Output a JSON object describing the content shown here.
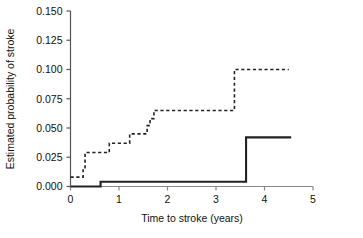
{
  "chart_data": {
    "type": "line",
    "title": "",
    "xlabel": "Time to stroke (years)",
    "ylabel": "Estimated probability of stroke",
    "xlim": [
      0,
      5
    ],
    "ylim": [
      0.0,
      0.15
    ],
    "xticks": [
      0,
      1,
      2,
      3,
      4,
      5
    ],
    "xtick_labels": [
      "0",
      "1",
      "2",
      "3",
      "4",
      "5"
    ],
    "yticks": [
      0.0,
      0.025,
      0.05,
      0.075,
      0.1,
      0.125,
      0.15
    ],
    "ytick_labels": [
      "0.000",
      "0.025",
      "0.050",
      "0.075",
      "0.100",
      "0.125",
      "0.150"
    ],
    "grid": false,
    "legend": null,
    "legend_position": "none",
    "series": [
      {
        "name": "dashed-curve",
        "style": "dashed",
        "color": "#222222",
        "step": "post",
        "x": [
          0.0,
          0.1,
          0.26,
          0.3,
          0.62,
          0.8,
          1.08,
          1.22,
          1.5,
          1.58,
          1.64,
          1.72,
          3.38,
          4.5
        ],
        "y": [
          0.008,
          0.008,
          0.015,
          0.029,
          0.029,
          0.037,
          0.037,
          0.045,
          0.045,
          0.052,
          0.058,
          0.065,
          0.1,
          0.1
        ]
      },
      {
        "name": "solid-curve",
        "style": "solid",
        "color": "#222222",
        "step": "post",
        "x": [
          0.0,
          0.62,
          3.62,
          4.55
        ],
        "y": [
          0.0,
          0.004,
          0.042,
          0.042
        ]
      }
    ]
  },
  "figure": {
    "background": "#ffffff",
    "axis_color": "#555555",
    "line_color": "#222222"
  }
}
